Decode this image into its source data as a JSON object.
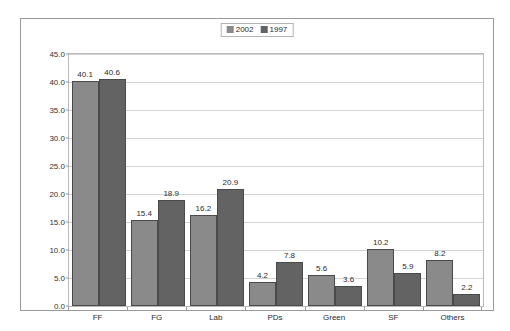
{
  "chart_data": {
    "type": "bar",
    "title": "",
    "subtitle": "",
    "xlabel": "",
    "ylabel": "",
    "categories": [
      "FF",
      "FG",
      "Lab",
      "PDs",
      "Green",
      "SF",
      "Others"
    ],
    "series": [
      {
        "name": "2002",
        "color": "#8a8a8a",
        "values": [
          40.1,
          15.4,
          16.2,
          4.2,
          5.6,
          10.2,
          8.2
        ]
      },
      {
        "name": "1997",
        "color": "#636363",
        "values": [
          40.6,
          18.9,
          20.9,
          7.8,
          3.6,
          5.9,
          2.2
        ]
      }
    ],
    "ylim": [
      0.0,
      45.0
    ],
    "ytick_step": 5.0,
    "ytick_labels": [
      "0.0",
      "5.0",
      "10.0",
      "15.0",
      "20.0",
      "25.0",
      "30.0",
      "35.0",
      "40.0",
      "45.0"
    ],
    "grid": true,
    "legend_position": "top-center",
    "data_labels": true,
    "data_label_format": "one-decimal",
    "bar_border_color": "#4a4a4a",
    "gridline_color": "#d4d4d4",
    "plot_border_color": "#b9b9b9",
    "frame_border_color": "#9a9a9a",
    "background_color": "#ffffff",
    "text_color": "#2b2b2b"
  },
  "legend": {
    "entries": [
      {
        "label": "2002",
        "color": "#8a8a8a"
      },
      {
        "label": "1997",
        "color": "#636363"
      }
    ]
  }
}
